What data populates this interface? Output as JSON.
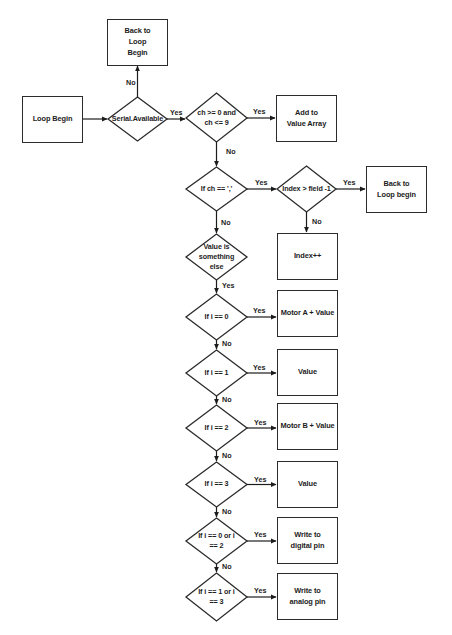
{
  "diagram": {
    "type": "flowchart",
    "nodes": {
      "loop_begin": "Loop Begin",
      "back_to_loop_begin_top": "Back to Loop Begin",
      "serial_available": "Serial.Available",
      "ch_range_check": "ch >= 0 and ch <= 9",
      "add_to_value_array": "Add to Value Array",
      "if_ch_comma": "If ch == ','",
      "index_gt_field": "Index > field -1",
      "back_to_loop_begin_right": "Back to Loop begin",
      "index_increment": "Index++",
      "value_is_something_else": "Value is something else",
      "if_i_0": "If i == 0",
      "motor_a_value": "Motor A + Value",
      "if_i_1": "If i == 1",
      "value_1": "Value",
      "if_i_2": "If i == 2",
      "motor_b_value": "Motor B + Value",
      "if_i_3": "If i == 3",
      "value_3": "Value",
      "if_i_0_or_2": "If i == 0 or i == 2",
      "write_digital_pin": "Write to digital pin",
      "if_i_1_or_3": "If i == 1 or i == 3",
      "write_analog_pin": "Write to analog pin"
    },
    "edge_labels": {
      "yes": "Yes",
      "no": "No"
    },
    "edges": [
      {
        "from": "loop_begin",
        "to": "serial_available",
        "label": ""
      },
      {
        "from": "serial_available",
        "to": "back_to_loop_begin_top",
        "label": "No"
      },
      {
        "from": "serial_available",
        "to": "ch_range_check",
        "label": "Yes"
      },
      {
        "from": "ch_range_check",
        "to": "add_to_value_array",
        "label": "Yes"
      },
      {
        "from": "ch_range_check",
        "to": "if_ch_comma",
        "label": "No"
      },
      {
        "from": "if_ch_comma",
        "to": "index_gt_field",
        "label": "Yes"
      },
      {
        "from": "index_gt_field",
        "to": "back_to_loop_begin_right",
        "label": "Yes"
      },
      {
        "from": "index_gt_field",
        "to": "index_increment",
        "label": "No"
      },
      {
        "from": "if_ch_comma",
        "to": "value_is_something_else",
        "label": "No"
      },
      {
        "from": "value_is_something_else",
        "to": "if_i_0",
        "label": "Yes"
      },
      {
        "from": "if_i_0",
        "to": "motor_a_value",
        "label": "Yes"
      },
      {
        "from": "if_i_0",
        "to": "if_i_1",
        "label": "No"
      },
      {
        "from": "if_i_1",
        "to": "value_1",
        "label": "Yes"
      },
      {
        "from": "if_i_1",
        "to": "if_i_2",
        "label": "No"
      },
      {
        "from": "if_i_2",
        "to": "motor_b_value",
        "label": "Yes"
      },
      {
        "from": "if_i_2",
        "to": "if_i_3",
        "label": "No"
      },
      {
        "from": "if_i_3",
        "to": "value_3",
        "label": "Yes"
      },
      {
        "from": "if_i_3",
        "to": "if_i_0_or_2",
        "label": "No"
      },
      {
        "from": "if_i_0_or_2",
        "to": "write_digital_pin",
        "label": "Yes"
      },
      {
        "from": "if_i_0_or_2",
        "to": "if_i_1_or_3",
        "label": "No"
      },
      {
        "from": "if_i_1_or_3",
        "to": "write_analog_pin",
        "label": "Yes"
      }
    ],
    "colors": {
      "stroke": "#2b2b2b",
      "text": "#1c1c1c",
      "background": "#ffffff"
    }
  }
}
